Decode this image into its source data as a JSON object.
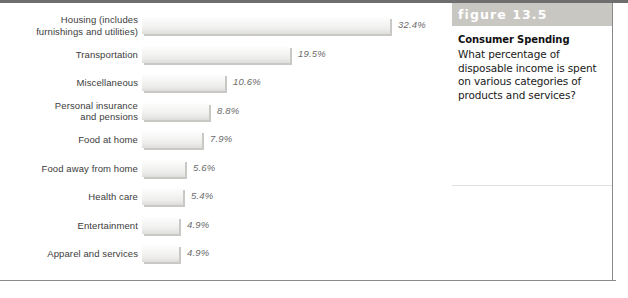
{
  "figure": {
    "number_label": "figure 13.5",
    "caption_title": "Consumer Spending",
    "caption_body": "What percentage of disposable income is spent on various categories of products and services?",
    "band_color": "#c9c7c2",
    "rule_color": "#6e6e6e"
  },
  "chart_data": {
    "type": "bar",
    "orientation": "horizontal",
    "title": "Consumer Spending",
    "xlabel": "",
    "ylabel": "",
    "value_suffix": "%",
    "grid": false,
    "legend": "none",
    "bar_color": "#ececeb",
    "label_color": "#6a6a6a",
    "categories": [
      "Housing (includes furnishings and utilities)",
      "Transportation",
      "Miscellaneous",
      "Personal insurance and pensions",
      "Food at home",
      "Food away from home",
      "Health care",
      "Entertainment",
      "Apparel and services"
    ],
    "values": [
      32.4,
      19.5,
      10.6,
      8.8,
      7.9,
      5.6,
      5.4,
      4.9,
      4.9
    ],
    "value_labels": [
      "32.4%",
      "19.5%",
      "10.6%",
      "8.8%",
      "7.9%",
      "5.6%",
      "5.4%",
      "4.9%",
      "4.9%"
    ],
    "bar_pixel_widths": [
      248,
      148,
      83,
      67,
      60,
      43,
      41,
      37,
      37
    ]
  },
  "rows": [
    {
      "label_line1": "Housing (includes",
      "label_line2": "furnishings and utilities)",
      "value_label": "32.4%",
      "bar_width": 248,
      "two_line": true
    },
    {
      "label_line1": "Transportation",
      "label_line2": "",
      "value_label": "19.5%",
      "bar_width": 148,
      "two_line": false
    },
    {
      "label_line1": "Miscellaneous",
      "label_line2": "",
      "value_label": "10.6%",
      "bar_width": 83,
      "two_line": false
    },
    {
      "label_line1": "Personal insurance",
      "label_line2": "and pensions",
      "value_label": "8.8%",
      "bar_width": 67,
      "two_line": true
    },
    {
      "label_line1": "Food at home",
      "label_line2": "",
      "value_label": "7.9%",
      "bar_width": 60,
      "two_line": false
    },
    {
      "label_line1": "Food away from home",
      "label_line2": "",
      "value_label": "5.6%",
      "bar_width": 43,
      "two_line": false
    },
    {
      "label_line1": "Health care",
      "label_line2": "",
      "value_label": "5.4%",
      "bar_width": 41,
      "two_line": false
    },
    {
      "label_line1": "Entertainment",
      "label_line2": "",
      "value_label": "4.9%",
      "bar_width": 37,
      "two_line": false
    },
    {
      "label_line1": "Apparel and services",
      "label_line2": "",
      "value_label": "4.9%",
      "bar_width": 37,
      "two_line": false
    }
  ]
}
